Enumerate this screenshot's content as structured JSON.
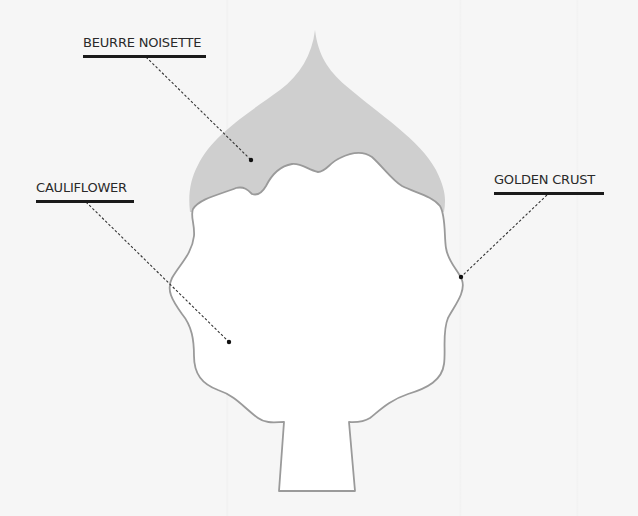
{
  "diagram": {
    "colors": {
      "background": "#f6f6f6",
      "body_fill": "#ffffff",
      "outline": "#9a9a9a",
      "sauce_fill": "#cfcfcf",
      "leader_line": "#333333",
      "underline": "#1a1a1a"
    },
    "labels": [
      {
        "id": "beurre-noisette",
        "text": "BEURRE NOISETTE",
        "anchor": [
          146,
          57
        ],
        "point": [
          251,
          160
        ]
      },
      {
        "id": "cauliflower",
        "text": "CAULIFLOWER",
        "anchor": [
          86,
          202
        ],
        "point": [
          229,
          342
        ]
      },
      {
        "id": "golden-crust",
        "text": "GOLDEN CRUST",
        "anchor": [
          547,
          195
        ],
        "point": [
          461,
          277
        ]
      }
    ]
  }
}
